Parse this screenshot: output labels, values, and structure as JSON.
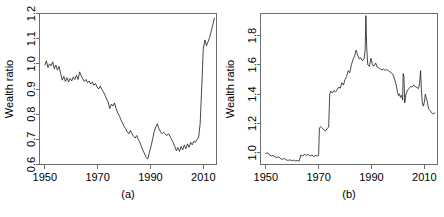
{
  "figure": {
    "background": "#ffffff",
    "line_color": "#1a1a1a",
    "axis_color": "#6e6e6e",
    "panel_count": 2
  },
  "chart_data": [
    {
      "type": "line",
      "panel_id": "a",
      "caption": "(a)",
      "title": "",
      "xlabel": "",
      "ylabel": "Wealth ratio",
      "xlim": [
        1948,
        2015
      ],
      "ylim": [
        0.6,
        1.2
      ],
      "xticks": [
        1950,
        1970,
        1990,
        2010
      ],
      "xticklabels": [
        "1950",
        "1970",
        "1990",
        "2010"
      ],
      "yticks": [
        0.6,
        0.7,
        0.8,
        0.9,
        1.0,
        1.1,
        1.2
      ],
      "yticklabels": [
        "0.6",
        "0.7",
        "0.8",
        "0.9",
        "1.0",
        "1.1",
        "1.2"
      ],
      "grid": false,
      "legend": null,
      "x": [
        1950.0,
        1950.6,
        1951.2,
        1951.8,
        1952.4,
        1953.0,
        1953.6,
        1954.2,
        1954.8,
        1955.4,
        1956.0,
        1956.6,
        1957.2,
        1957.8,
        1958.4,
        1959.0,
        1959.6,
        1960.2,
        1960.8,
        1961.4,
        1962.0,
        1962.6,
        1963.2,
        1963.8,
        1964.4,
        1965.0,
        1965.6,
        1966.2,
        1966.8,
        1967.4,
        1968.0,
        1968.6,
        1969.2,
        1969.8,
        1970.4,
        1971.0,
        1971.6,
        1972.2,
        1972.8,
        1973.4,
        1974.0,
        1974.6,
        1975.2,
        1975.8,
        1976.4,
        1977.0,
        1977.6,
        1978.2,
        1978.8,
        1979.4,
        1980.0,
        1980.6,
        1981.2,
        1981.8,
        1982.4,
        1983.0,
        1983.6,
        1984.2,
        1984.8,
        1985.4,
        1986.0,
        1986.6,
        1987.2,
        1987.8,
        1988.4,
        1989.0,
        1989.6,
        1990.2,
        1990.8,
        1991.4,
        1992.0,
        1992.6,
        1993.2,
        1993.8,
        1994.4,
        1995.0,
        1995.6,
        1996.2,
        1996.8,
        1997.4,
        1998.0,
        1998.6,
        1999.2,
        1999.8,
        2000.4,
        2001.0,
        2001.6,
        2002.2,
        2002.8,
        2003.4,
        2004.0,
        2004.6,
        2005.2,
        2005.8,
        2006.4,
        2007.0,
        2007.6,
        2008.2,
        2008.8,
        2009.4,
        2010.0,
        2010.6,
        2011.2,
        2011.8,
        2012.4,
        2013.0,
        2013.6,
        2014.2
      ],
      "y": [
        0.995,
        1.012,
        0.985,
        1.0,
        0.992,
        1.008,
        0.98,
        0.995,
        0.975,
        0.99,
        0.962,
        0.935,
        0.95,
        0.93,
        0.945,
        0.928,
        0.942,
        0.932,
        0.948,
        0.938,
        0.955,
        0.938,
        0.968,
        0.952,
        0.94,
        0.93,
        0.938,
        0.925,
        0.932,
        0.92,
        0.928,
        0.915,
        0.922,
        0.908,
        0.9,
        0.912,
        0.898,
        0.888,
        0.875,
        0.86,
        0.848,
        0.822,
        0.84,
        0.832,
        0.845,
        0.822,
        0.805,
        0.795,
        0.778,
        0.765,
        0.752,
        0.742,
        0.73,
        0.722,
        0.735,
        0.722,
        0.712,
        0.705,
        0.715,
        0.7,
        0.688,
        0.67,
        0.655,
        0.642,
        0.628,
        0.622,
        0.648,
        0.672,
        0.7,
        0.73,
        0.748,
        0.762,
        0.742,
        0.73,
        0.722,
        0.728,
        0.722,
        0.715,
        0.722,
        0.712,
        0.7,
        0.688,
        0.672,
        0.655,
        0.668,
        0.652,
        0.672,
        0.658,
        0.678,
        0.662,
        0.682,
        0.668,
        0.688,
        0.678,
        0.692,
        0.688,
        0.7,
        0.705,
        0.76,
        0.905,
        1.06,
        1.095,
        1.072,
        1.088,
        1.105,
        1.13,
        1.155,
        1.182
      ]
    },
    {
      "type": "line",
      "panel_id": "b",
      "caption": "(b)",
      "title": "",
      "xlabel": "",
      "ylabel": "Wealth ratio",
      "xlim": [
        1948,
        2015
      ],
      "ylim": [
        0.92,
        1.95
      ],
      "xticks": [
        1950,
        1970,
        1990,
        2010
      ],
      "xticklabels": [
        "1950",
        "1970",
        "1990",
        "2010"
      ],
      "yticks": [
        1.0,
        1.2,
        1.4,
        1.6,
        1.8
      ],
      "yticklabels": [
        "1.0",
        "1.2",
        "1.4",
        "1.6",
        "1.8"
      ],
      "grid": false,
      "legend": null,
      "x": [
        1950.0,
        1950.7,
        1951.4,
        1952.1,
        1952.8,
        1953.5,
        1954.2,
        1954.9,
        1955.6,
        1956.3,
        1957.0,
        1957.7,
        1958.4,
        1959.1,
        1959.8,
        1960.5,
        1961.2,
        1961.9,
        1962.6,
        1963.3,
        1964.0,
        1964.7,
        1965.4,
        1966.1,
        1966.8,
        1967.5,
        1968.2,
        1968.9,
        1969.6,
        1970.0,
        1970.3,
        1970.8,
        1971.4,
        1972.0,
        1972.6,
        1973.2,
        1973.8,
        1974.2,
        1974.6,
        1975.2,
        1975.8,
        1976.4,
        1977.0,
        1977.6,
        1978.2,
        1978.8,
        1979.4,
        1980.0,
        1980.6,
        1981.2,
        1981.8,
        1982.4,
        1983.0,
        1983.6,
        1984.2,
        1984.8,
        1985.4,
        1986.0,
        1986.6,
        1987.2,
        1987.6,
        1987.9,
        1988.2,
        1988.6,
        1989.2,
        1989.8,
        1990.4,
        1991.0,
        1991.6,
        1992.2,
        1992.8,
        1993.4,
        1994.0,
        1994.6,
        1995.2,
        1995.8,
        1996.4,
        1997.0,
        1997.6,
        1998.2,
        1998.8,
        1999.4,
        1999.8,
        2000.2,
        2000.6,
        2001.0,
        2001.4,
        2001.8,
        2002.0,
        2002.3,
        2002.6,
        2003.0,
        2003.6,
        2004.2,
        2004.8,
        2005.4,
        2006.0,
        2006.6,
        2007.2,
        2007.8,
        2008.2,
        2008.6,
        2008.9,
        2009.2,
        2009.6,
        2010.0,
        2010.4,
        2010.8,
        2011.2,
        2011.6,
        2012.2,
        2012.8,
        2013.4,
        2014.0
      ],
      "y": [
        0.995,
        1.0,
        0.985,
        0.978,
        0.982,
        0.972,
        0.968,
        0.972,
        0.96,
        0.955,
        0.962,
        0.952,
        0.948,
        0.952,
        0.946,
        0.95,
        0.944,
        0.948,
        0.942,
        0.985,
        0.978,
        0.99,
        0.982,
        0.988,
        0.978,
        0.985,
        0.975,
        0.982,
        0.978,
        0.982,
        1.17,
        1.178,
        1.165,
        1.158,
        1.148,
        1.165,
        1.175,
        1.4,
        1.42,
        1.408,
        1.425,
        1.415,
        1.43,
        1.448,
        1.44,
        1.478,
        1.462,
        1.5,
        1.52,
        1.56,
        1.545,
        1.6,
        1.635,
        1.66,
        1.7,
        1.665,
        1.64,
        1.648,
        1.628,
        1.64,
        1.7,
        1.935,
        1.72,
        1.6,
        1.59,
        1.645,
        1.6,
        1.592,
        1.612,
        1.585,
        1.578,
        1.572,
        1.565,
        1.57,
        1.562,
        1.568,
        1.56,
        1.552,
        1.545,
        1.53,
        1.498,
        1.462,
        1.42,
        1.39,
        1.402,
        1.378,
        1.392,
        1.36,
        1.54,
        1.52,
        1.34,
        1.395,
        1.425,
        1.44,
        1.452,
        1.448,
        1.46,
        1.452,
        1.445,
        1.438,
        1.47,
        1.56,
        1.43,
        1.35,
        1.318,
        1.342,
        1.4,
        1.372,
        1.345,
        1.3,
        1.288,
        1.272,
        1.265,
        1.272
      ]
    }
  ]
}
